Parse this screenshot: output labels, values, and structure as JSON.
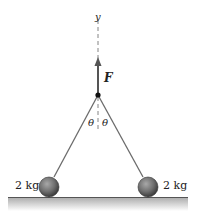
{
  "diagram": {
    "axis_label": "y",
    "force_label": "F",
    "angle_left_label": "θ",
    "angle_right_label": "θ",
    "mass_left_label": "2 kg",
    "mass_right_label": "2 kg",
    "colors": {
      "rod": "#6b6b6b",
      "ball": "#7a7a7a",
      "ground": "#b8b8b8",
      "arrow": "#555555"
    }
  }
}
